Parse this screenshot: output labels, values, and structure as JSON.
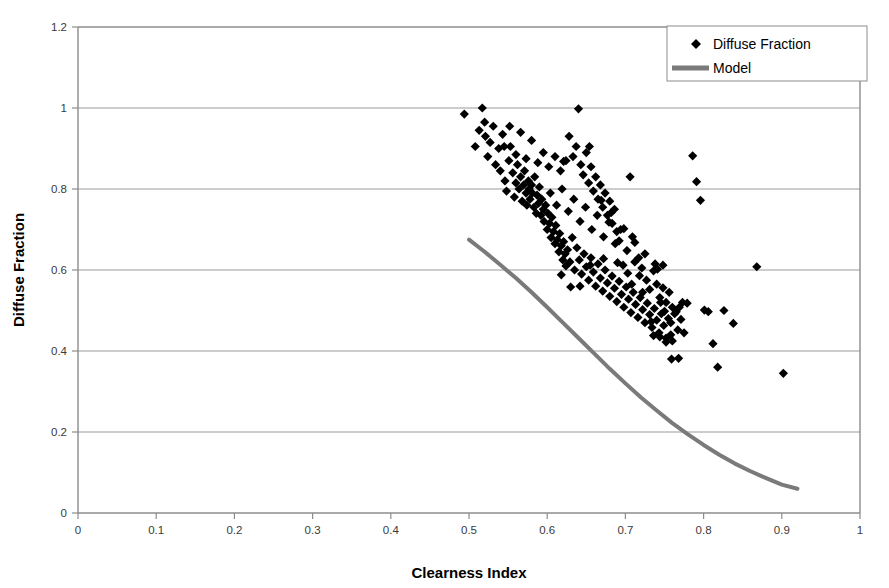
{
  "chart_data": {
    "type": "scatter",
    "title": "",
    "xlabel": "Clearness Index",
    "ylabel": "Diffuse Fraction",
    "xlim": [
      0,
      1
    ],
    "ylim": [
      0,
      1.2
    ],
    "xticks": [
      "0",
      "0.1",
      "0.2",
      "0.3",
      "0.4",
      "0.5",
      "0.6",
      "0.7",
      "0.8",
      "0.9",
      "1"
    ],
    "xtick_values": [
      0,
      0.1,
      0.2,
      0.3,
      0.4,
      0.5,
      0.6,
      0.7,
      0.8,
      0.9,
      1
    ],
    "yticks": [
      "0",
      "0.2",
      "0.4",
      "0.6",
      "0.8",
      "1",
      "1.2"
    ],
    "ytick_values": [
      0,
      0.2,
      0.4,
      0.6,
      0.8,
      1.0,
      1.2
    ],
    "grid": {
      "horizontal": true,
      "vertical": false
    },
    "legend": {
      "position": "top-right",
      "entries": [
        {
          "label": "Diffuse Fraction",
          "marker": "diamond",
          "color": "#000000"
        },
        {
          "label": "Model",
          "marker": "line",
          "color": "#7a7a7a"
        }
      ]
    },
    "series": [
      {
        "name": "Diffuse Fraction",
        "type": "scatter",
        "marker": "diamond",
        "color": "#000000",
        "points": [
          [
            0.494,
            0.985
          ],
          [
            0.508,
            0.905
          ],
          [
            0.513,
            0.945
          ],
          [
            0.517,
            1.0
          ],
          [
            0.52,
            0.965
          ],
          [
            0.521,
            0.93
          ],
          [
            0.524,
            0.88
          ],
          [
            0.527,
            0.915
          ],
          [
            0.531,
            0.955
          ],
          [
            0.534,
            0.86
          ],
          [
            0.538,
            0.9
          ],
          [
            0.54,
            0.845
          ],
          [
            0.543,
            0.935
          ],
          [
            0.546,
            0.82
          ],
          [
            0.548,
            0.795
          ],
          [
            0.551,
            0.87
          ],
          [
            0.553,
            0.905
          ],
          [
            0.556,
            0.84
          ],
          [
            0.558,
            0.78
          ],
          [
            0.56,
            0.815
          ],
          [
            0.562,
            0.86
          ],
          [
            0.564,
            0.8
          ],
          [
            0.566,
            0.83
          ],
          [
            0.568,
            0.77
          ],
          [
            0.57,
            0.81
          ],
          [
            0.571,
            0.845
          ],
          [
            0.573,
            0.79
          ],
          [
            0.574,
            0.76
          ],
          [
            0.576,
            0.82
          ],
          [
            0.577,
            0.8
          ],
          [
            0.578,
            0.775
          ],
          [
            0.58,
            0.81
          ],
          [
            0.581,
            0.79
          ],
          [
            0.583,
            0.755
          ],
          [
            0.584,
            0.83
          ],
          [
            0.586,
            0.74
          ],
          [
            0.587,
            0.785
          ],
          [
            0.589,
            0.765
          ],
          [
            0.59,
            0.805
          ],
          [
            0.592,
            0.735
          ],
          [
            0.593,
            0.775
          ],
          [
            0.595,
            0.75
          ],
          [
            0.596,
            0.72
          ],
          [
            0.598,
            0.76
          ],
          [
            0.6,
            0.7
          ],
          [
            0.601,
            0.74
          ],
          [
            0.603,
            0.715
          ],
          [
            0.605,
            0.68
          ],
          [
            0.606,
            0.73
          ],
          [
            0.608,
            0.695
          ],
          [
            0.61,
            0.665
          ],
          [
            0.611,
            0.71
          ],
          [
            0.613,
            0.675
          ],
          [
            0.615,
            0.645
          ],
          [
            0.616,
            0.69
          ],
          [
            0.618,
            0.66
          ],
          [
            0.62,
            0.625
          ],
          [
            0.621,
            0.67
          ],
          [
            0.623,
            0.64
          ],
          [
            0.624,
            0.61
          ],
          [
            0.545,
            0.905
          ],
          [
            0.552,
            0.955
          ],
          [
            0.56,
            0.885
          ],
          [
            0.566,
            0.94
          ],
          [
            0.573,
            0.875
          ],
          [
            0.58,
            0.92
          ],
          [
            0.588,
            0.865
          ],
          [
            0.595,
            0.89
          ],
          [
            0.602,
            0.855
          ],
          [
            0.61,
            0.88
          ],
          [
            0.617,
            0.845
          ],
          [
            0.624,
            0.87
          ],
          [
            0.628,
            0.93
          ],
          [
            0.633,
            0.88
          ],
          [
            0.637,
            0.905
          ],
          [
            0.64,
            0.998
          ],
          [
            0.643,
            0.86
          ],
          [
            0.646,
            0.835
          ],
          [
            0.65,
            0.89
          ],
          [
            0.653,
            0.815
          ],
          [
            0.656,
            0.855
          ],
          [
            0.659,
            0.795
          ],
          [
            0.662,
            0.83
          ],
          [
            0.665,
            0.775
          ],
          [
            0.668,
            0.81
          ],
          [
            0.671,
            0.755
          ],
          [
            0.674,
            0.79
          ],
          [
            0.677,
            0.735
          ],
          [
            0.68,
            0.77
          ],
          [
            0.683,
            0.715
          ],
          [
            0.686,
            0.75
          ],
          [
            0.689,
            0.695
          ],
          [
            0.626,
            0.65
          ],
          [
            0.629,
            0.62
          ],
          [
            0.632,
            0.68
          ],
          [
            0.635,
            0.6
          ],
          [
            0.638,
            0.655
          ],
          [
            0.641,
            0.625
          ],
          [
            0.644,
            0.59
          ],
          [
            0.647,
            0.64
          ],
          [
            0.65,
            0.608
          ],
          [
            0.653,
            0.575
          ],
          [
            0.656,
            0.63
          ],
          [
            0.659,
            0.595
          ],
          [
            0.662,
            0.56
          ],
          [
            0.665,
            0.615
          ],
          [
            0.668,
            0.58
          ],
          [
            0.671,
            0.548
          ],
          [
            0.674,
            0.6
          ],
          [
            0.677,
            0.568
          ],
          [
            0.68,
            0.535
          ],
          [
            0.683,
            0.585
          ],
          [
            0.686,
            0.555
          ],
          [
            0.689,
            0.522
          ],
          [
            0.692,
            0.572
          ],
          [
            0.695,
            0.54
          ],
          [
            0.698,
            0.508
          ],
          [
            0.701,
            0.558
          ],
          [
            0.704,
            0.528
          ],
          [
            0.707,
            0.495
          ],
          [
            0.71,
            0.545
          ],
          [
            0.713,
            0.515
          ],
          [
            0.716,
            0.483
          ],
          [
            0.719,
            0.532
          ],
          [
            0.722,
            0.502
          ],
          [
            0.725,
            0.47
          ],
          [
            0.728,
            0.518
          ],
          [
            0.731,
            0.49
          ],
          [
            0.734,
            0.458
          ],
          [
            0.737,
            0.505
          ],
          [
            0.74,
            0.476
          ],
          [
            0.743,
            0.445
          ],
          [
            0.746,
            0.492
          ],
          [
            0.749,
            0.463
          ],
          [
            0.752,
            0.432
          ],
          [
            0.755,
            0.48
          ],
          [
            0.604,
            0.79
          ],
          [
            0.612,
            0.76
          ],
          [
            0.619,
            0.8
          ],
          [
            0.627,
            0.745
          ],
          [
            0.634,
            0.775
          ],
          [
            0.642,
            0.72
          ],
          [
            0.649,
            0.755
          ],
          [
            0.657,
            0.7
          ],
          [
            0.664,
            0.735
          ],
          [
            0.672,
            0.682
          ],
          [
            0.679,
            0.718
          ],
          [
            0.687,
            0.665
          ],
          [
            0.694,
            0.7
          ],
          [
            0.702,
            0.648
          ],
          [
            0.709,
            0.682
          ],
          [
            0.717,
            0.63
          ],
          [
            0.692,
            0.672
          ],
          [
            0.697,
            0.612
          ],
          [
            0.703,
            0.592
          ],
          [
            0.708,
            0.565
          ],
          [
            0.712,
            0.62
          ],
          [
            0.718,
            0.586
          ],
          [
            0.722,
            0.545
          ],
          [
            0.727,
            0.575
          ],
          [
            0.731,
            0.552
          ],
          [
            0.736,
            0.598
          ],
          [
            0.74,
            0.565
          ],
          [
            0.744,
            0.532
          ],
          [
            0.748,
            0.556
          ],
          [
            0.752,
            0.52
          ],
          [
            0.756,
            0.545
          ],
          [
            0.76,
            0.508
          ],
          [
            0.621,
            0.868
          ],
          [
            0.654,
            0.905
          ],
          [
            0.669,
            0.772
          ],
          [
            0.682,
            0.742
          ],
          [
            0.698,
            0.702
          ],
          [
            0.712,
            0.668
          ],
          [
            0.725,
            0.64
          ],
          [
            0.738,
            0.615
          ],
          [
            0.745,
            0.52
          ],
          [
            0.75,
            0.498
          ],
          [
            0.758,
            0.47
          ],
          [
            0.763,
            0.492
          ],
          [
            0.767,
            0.452
          ],
          [
            0.771,
            0.478
          ],
          [
            0.775,
            0.445
          ],
          [
            0.758,
            0.44
          ],
          [
            0.706,
            0.83
          ],
          [
            0.721,
            0.605
          ],
          [
            0.733,
            0.472
          ],
          [
            0.741,
            0.602
          ],
          [
            0.748,
            0.612
          ],
          [
            0.69,
            0.618
          ],
          [
            0.672,
            0.628
          ],
          [
            0.655,
            0.612
          ],
          [
            0.642,
            0.56
          ],
          [
            0.63,
            0.558
          ],
          [
            0.618,
            0.588
          ],
          [
            0.76,
            0.425
          ],
          [
            0.752,
            0.422
          ],
          [
            0.744,
            0.435
          ],
          [
            0.736,
            0.438
          ],
          [
            0.765,
            0.497
          ],
          [
            0.769,
            0.508
          ],
          [
            0.773,
            0.52
          ],
          [
            0.759,
            0.38
          ],
          [
            0.768,
            0.382
          ],
          [
            0.779,
            0.518
          ],
          [
            0.786,
            0.882
          ],
          [
            0.791,
            0.818
          ],
          [
            0.796,
            0.772
          ],
          [
            0.801,
            0.501
          ],
          [
            0.806,
            0.497
          ],
          [
            0.812,
            0.418
          ],
          [
            0.818,
            0.36
          ],
          [
            0.826,
            0.5
          ],
          [
            0.838,
            0.468
          ],
          [
            0.868,
            0.608
          ],
          [
            0.902,
            0.345
          ]
        ]
      },
      {
        "name": "Model",
        "type": "line",
        "color": "#7a7a7a",
        "width": 4,
        "points": [
          [
            0.5,
            0.675
          ],
          [
            0.52,
            0.645
          ],
          [
            0.54,
            0.613
          ],
          [
            0.56,
            0.58
          ],
          [
            0.58,
            0.545
          ],
          [
            0.6,
            0.508
          ],
          [
            0.62,
            0.47
          ],
          [
            0.64,
            0.432
          ],
          [
            0.66,
            0.394
          ],
          [
            0.68,
            0.356
          ],
          [
            0.7,
            0.32
          ],
          [
            0.72,
            0.285
          ],
          [
            0.74,
            0.253
          ],
          [
            0.76,
            0.222
          ],
          [
            0.78,
            0.194
          ],
          [
            0.8,
            0.168
          ],
          [
            0.82,
            0.144
          ],
          [
            0.84,
            0.122
          ],
          [
            0.86,
            0.103
          ],
          [
            0.88,
            0.086
          ],
          [
            0.9,
            0.07
          ],
          [
            0.92,
            0.06
          ]
        ]
      }
    ]
  },
  "axes": {
    "x_title": "Clearness Index",
    "y_title": "Diffuse Fraction"
  }
}
